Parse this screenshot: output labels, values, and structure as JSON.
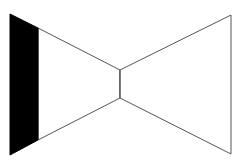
{
  "diagram": {
    "shape": "bowtie",
    "background": "#ffffff",
    "stroke": "#555555",
    "fill_dark": "#000000",
    "left_black_band": {
      "points": [
        [
          10,
          14
        ],
        [
          38,
          28
        ],
        [
          38,
          140
        ],
        [
          10,
          155
        ]
      ]
    },
    "left_wedge": {
      "points": [
        [
          38,
          28
        ],
        [
          120,
          70
        ],
        [
          120,
          98
        ],
        [
          38,
          140
        ]
      ]
    },
    "center_segment": {
      "x1": 120,
      "y1": 70,
      "x2": 120,
      "y2": 98
    },
    "right_wedge": {
      "points": [
        [
          120,
          70
        ],
        [
          231,
          15
        ],
        [
          231,
          154
        ],
        [
          120,
          98
        ]
      ]
    }
  }
}
